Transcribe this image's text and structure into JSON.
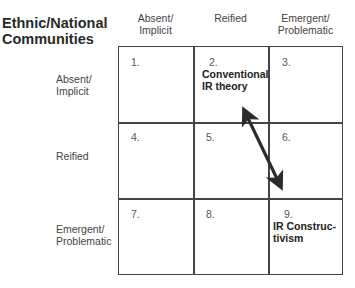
{
  "title_line1": "Ethnic/National",
  "title_line2": "Communities",
  "columns": [
    {
      "line1": "Absent/",
      "line2": "Implicit"
    },
    {
      "line1": "Reified",
      "line2": ""
    },
    {
      "line1": "Emergent/",
      "line2": "Problematic"
    }
  ],
  "rows": [
    {
      "line1": "Absent/",
      "line2": "Implicit"
    },
    {
      "line1": "Reified",
      "line2": ""
    },
    {
      "line1": "Emergent/",
      "line2": "Problematic"
    }
  ],
  "cells": [
    {
      "num": "1.",
      "label1": "",
      "label2": ""
    },
    {
      "num": "2.",
      "label1": "Conventional",
      "label2": "IR theory"
    },
    {
      "num": "3.",
      "label1": "",
      "label2": ""
    },
    {
      "num": "4.",
      "label1": "",
      "label2": ""
    },
    {
      "num": "5.",
      "label1": "",
      "label2": ""
    },
    {
      "num": "6.",
      "label1": "",
      "label2": ""
    },
    {
      "num": "7.",
      "label1": "",
      "label2": ""
    },
    {
      "num": "8.",
      "label1": "",
      "label2": ""
    },
    {
      "num": "9.",
      "label1": "IR Construc-",
      "label2": "tivism"
    }
  ],
  "arrow": {
    "type": "double-headed",
    "from_cell": 2,
    "to_cell": 9,
    "color": "#2b2b2b"
  }
}
